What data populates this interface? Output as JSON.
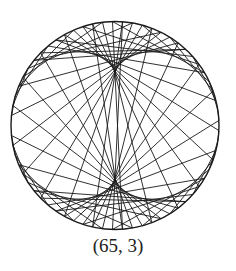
{
  "diagram": {
    "type": "modular-multiplication-circle",
    "points": 65,
    "multiplier": 3,
    "circle": {
      "cx": 115,
      "cy": 125.5,
      "r": 104
    },
    "start_angle_deg": 180,
    "stroke_color": "#1a1a1a",
    "background": "#ffffff"
  },
  "caption": "(65, 3)"
}
